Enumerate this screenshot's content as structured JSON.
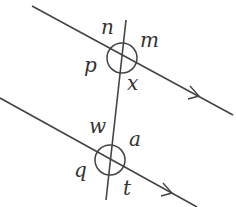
{
  "diagram": {
    "type": "parallel-lines-transversal",
    "colors": {
      "line": "#444444",
      "label": "#333333",
      "background": "#ffffff"
    },
    "parallel_lines": [
      {
        "id": "upper",
        "x1": 32,
        "y1": 6,
        "x2": 233,
        "y2": 115,
        "arrow_at": [
          198,
          96
        ]
      },
      {
        "id": "lower",
        "x1": 0,
        "y1": 98,
        "x2": 197,
        "y2": 207,
        "arrow_at": [
          171,
          193
        ]
      }
    ],
    "transversal": {
      "x1": 126,
      "y1": 20,
      "x2": 106,
      "y2": 200
    },
    "intersections": [
      {
        "id": "upper",
        "cx": 122,
        "cy": 58,
        "r": 15
      },
      {
        "id": "lower",
        "cx": 110,
        "cy": 160,
        "r": 15
      }
    ],
    "labels": {
      "n": "n",
      "m": "m",
      "p": "p",
      "x": "x",
      "w": "w",
      "a": "a",
      "q": "q",
      "t": "t"
    }
  }
}
